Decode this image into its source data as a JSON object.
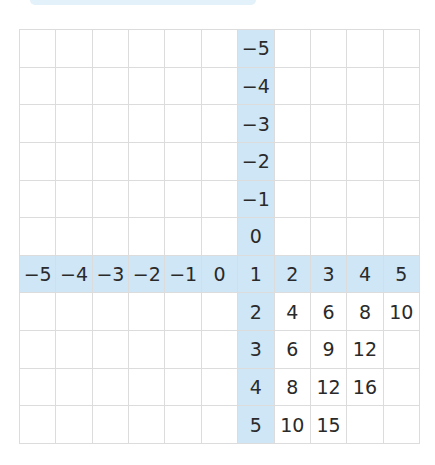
{
  "diagram": {
    "type": "multiplication-grid",
    "rows": 11,
    "cols": 11,
    "highlight_color": "#cfe6f6",
    "grid_line_color": "#dcdcdc",
    "highlight_row_index": 6,
    "highlight_col_index": 6,
    "cells": [
      [
        "",
        "",
        "",
        "",
        "",
        "",
        "−5",
        "",
        "",
        "",
        ""
      ],
      [
        "",
        "",
        "",
        "",
        "",
        "",
        "−4",
        "",
        "",
        "",
        ""
      ],
      [
        "",
        "",
        "",
        "",
        "",
        "",
        "−3",
        "",
        "",
        "",
        ""
      ],
      [
        "",
        "",
        "",
        "",
        "",
        "",
        "−2",
        "",
        "",
        "",
        ""
      ],
      [
        "",
        "",
        "",
        "",
        "",
        "",
        "−1",
        "",
        "",
        "",
        ""
      ],
      [
        "",
        "",
        "",
        "",
        "",
        "",
        "0",
        "",
        "",
        "",
        ""
      ],
      [
        "−5",
        "−4",
        "−3",
        "−2",
        "−1",
        "0",
        "1",
        "2",
        "3",
        "4",
        "5"
      ],
      [
        "",
        "",
        "",
        "",
        "",
        "",
        "2",
        "4",
        "6",
        "8",
        "10"
      ],
      [
        "",
        "",
        "",
        "",
        "",
        "",
        "3",
        "6",
        "9",
        "12",
        ""
      ],
      [
        "",
        "",
        "",
        "",
        "",
        "",
        "4",
        "8",
        "12",
        "16",
        ""
      ],
      [
        "",
        "",
        "",
        "",
        "",
        "",
        "5",
        "10",
        "15",
        "",
        ""
      ]
    ]
  }
}
